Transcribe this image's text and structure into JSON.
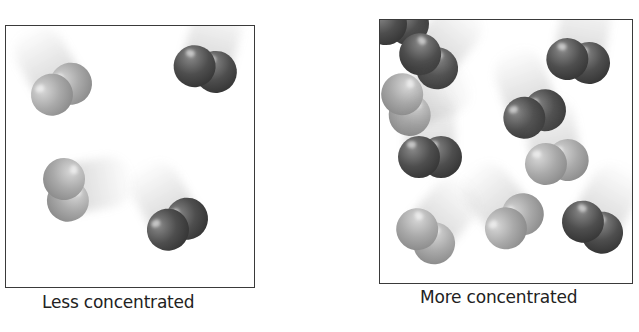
{
  "figure": {
    "panels": [
      {
        "id": "less",
        "caption": "Less concentrated",
        "molecule_count": 4,
        "molecules": [
          {
            "type": "light",
            "x": 62,
            "y": 90,
            "angle": -30
          },
          {
            "type": "dark",
            "x": 205,
            "y": 70,
            "angle": 15
          },
          {
            "type": "light",
            "x": 65,
            "y": 190,
            "angle": 80
          },
          {
            "type": "dark",
            "x": 178,
            "y": 225,
            "angle": -30
          }
        ]
      },
      {
        "id": "more",
        "caption": "More concentrated",
        "molecule_count": 10,
        "collisions": 2,
        "molecules": [
          {
            "type": "dark",
            "x": 397,
            "y": 25,
            "angle": 0
          },
          {
            "type": "dark",
            "x": 428,
            "y": 62,
            "angle": 40
          },
          {
            "type": "light",
            "x": 405,
            "y": 105,
            "angle": 70
          },
          {
            "type": "dark",
            "x": 578,
            "y": 62,
            "angle": 10
          },
          {
            "type": "dark",
            "x": 535,
            "y": 115,
            "angle": -20
          },
          {
            "type": "light",
            "x": 557,
            "y": 163,
            "angle": -10
          },
          {
            "type": "dark",
            "x": 430,
            "y": 158,
            "angle": 0
          },
          {
            "type": "light",
            "x": 425,
            "y": 237,
            "angle": 40
          },
          {
            "type": "light",
            "x": 515,
            "y": 222,
            "angle": -40
          },
          {
            "type": "dark",
            "x": 592,
            "y": 228,
            "angle": 30
          }
        ]
      }
    ],
    "colors": {
      "frame": "#3a3a3a",
      "light_atom": "#a9a9a9",
      "dark_atom": "#4e4e4e",
      "caption": "#222222"
    }
  }
}
